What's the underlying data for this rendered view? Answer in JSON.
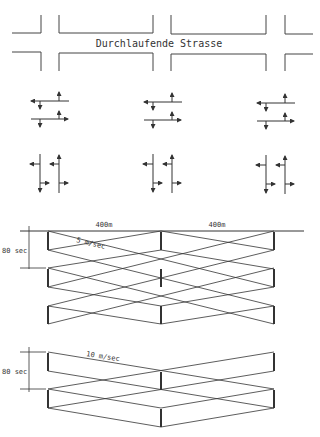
{
  "street_plan": {
    "street_label": "Durchlaufende Strasse"
  },
  "phase_icons": {
    "columns": 3,
    "rows": [
      "east-west-movements",
      "north-south-movements"
    ]
  },
  "diagram_upper": {
    "distance_1": "400m",
    "distance_2": "400m",
    "speed": "5 m/sec",
    "cycle": "80 sec"
  },
  "diagram_lower": {
    "speed": "10 m/sec",
    "cycle": "80 sec"
  },
  "colors": {
    "line": "#333333",
    "background": "#ffffff"
  }
}
